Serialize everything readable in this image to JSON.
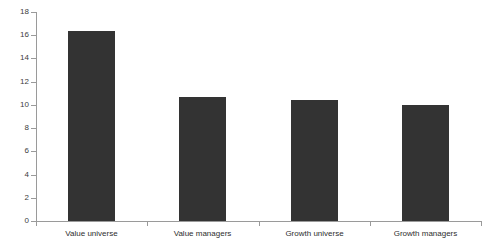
{
  "chart_data": {
    "type": "bar",
    "title": "",
    "subtitle": "",
    "xlabel": "",
    "ylabel": "",
    "categories": [
      "Value universe",
      "Value managers",
      "Growth universe",
      "Growth managers"
    ],
    "values": [
      16.4,
      10.7,
      10.4,
      10.0
    ],
    "ylim": [
      0,
      18
    ],
    "ytick_step": 2,
    "ytick_labels": [
      "0",
      "2",
      "4",
      "6",
      "8",
      "10",
      "12",
      "14",
      "16",
      "18"
    ],
    "ytick_values": [
      0,
      2,
      4,
      6,
      8,
      10,
      12,
      14,
      16,
      18
    ],
    "grid": false,
    "legend": null,
    "legend_position": "none",
    "bar_color": "#333333",
    "axis_color": "#9a9a9a",
    "text_color": "#2e2e2e",
    "background": "#ffffff",
    "annotations": []
  }
}
